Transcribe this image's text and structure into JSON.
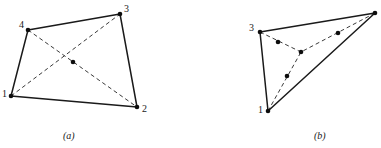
{
  "figures": [
    {
      "caption": "(a)",
      "caption_pos": {
        "x": 63,
        "y": 131
      },
      "shape": "quadrilateral",
      "vertices": [
        {
          "id": "1",
          "x": 11,
          "y": 96,
          "label": "1",
          "label_x": 2,
          "label_y": 89
        },
        {
          "id": "2",
          "x": 137,
          "y": 107,
          "label": "2",
          "label_x": 142,
          "label_y": 104
        },
        {
          "id": "3",
          "x": 120,
          "y": 14,
          "label": "3",
          "label_x": 124,
          "label_y": 4
        },
        {
          "id": "4",
          "x": 28,
          "y": 30,
          "label": "4",
          "label_x": 19,
          "label_y": 20
        }
      ],
      "solid_edges": [
        {
          "from": "1",
          "to": "4"
        },
        {
          "from": "4",
          "to": "3"
        },
        {
          "from": "3",
          "to": "2"
        },
        {
          "from": "2",
          "to": "1"
        }
      ],
      "dashed_edges": [
        {
          "from": "1",
          "to": "3"
        },
        {
          "from": "4",
          "to": "2"
        }
      ],
      "interior_points": [
        {
          "id": "c",
          "x": 73,
          "y": 62
        }
      ]
    },
    {
      "caption": "(b)",
      "caption_pos": {
        "x": 314,
        "y": 131
      },
      "shape": "triangle",
      "vertices": [
        {
          "id": "1",
          "x": 268,
          "y": 111,
          "label": "1",
          "label_x": 258,
          "label_y": 105
        },
        {
          "id": "2",
          "x": 375,
          "y": 13,
          "label": "",
          "label_x": 0,
          "label_y": 0
        },
        {
          "id": "3",
          "x": 260,
          "y": 32,
          "label": "3",
          "label_x": 249,
          "label_y": 23
        }
      ],
      "solid_edges": [
        {
          "from": "3",
          "to": "2"
        },
        {
          "from": "2",
          "to": "1"
        },
        {
          "from": "1",
          "to": "3"
        }
      ],
      "dashed_edges": [
        {
          "from": "3",
          "to": "centroid"
        },
        {
          "from": "2",
          "to": "centroid"
        },
        {
          "from": "1",
          "to": "centroid"
        }
      ],
      "interior_points": [
        {
          "id": "centroid",
          "x": 301,
          "y": 52
        },
        {
          "id": "m1",
          "x": 278,
          "y": 42
        },
        {
          "id": "m2",
          "x": 338,
          "y": 33
        },
        {
          "id": "m3",
          "x": 287,
          "y": 76
        }
      ]
    }
  ],
  "style": {
    "solid_color": "#1a1a1a",
    "dashed_color": "#3a3a3a",
    "dot_color": "#0d0d0d",
    "background": "#ffffff",
    "dot_radius": 2.3,
    "solid_width": 1.5,
    "dashed_width": 1
  }
}
